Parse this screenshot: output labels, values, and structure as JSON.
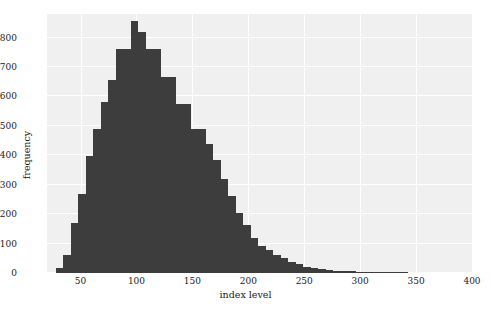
{
  "chart_data": {
    "type": "bar",
    "subtype": "histogram",
    "title": "",
    "xlabel": "index level",
    "ylabel": "frequency",
    "xlim": [
      20,
      400
    ],
    "ylim": [
      0,
      880
    ],
    "xticks": [
      50,
      100,
      150,
      200,
      250,
      300,
      350,
      400
    ],
    "yticks": [
      0,
      100,
      200,
      300,
      400,
      500,
      600,
      700,
      800
    ],
    "xtick_labels": [
      "50",
      "100",
      "150",
      "200",
      "250",
      "300",
      "350",
      "400"
    ],
    "ytick_labels": [
      "0",
      "100",
      "200",
      "300",
      "400",
      "500",
      "600",
      "700",
      "800"
    ],
    "grid": true,
    "legend": null,
    "bin_width": 6.7,
    "bar_color": "#3d3d3d",
    "plot_background": "#f0f0f0",
    "gridline_color": "#ffffff",
    "bin_starts": [
      28.0,
      34.7,
      41.4,
      48.1,
      54.8,
      61.5,
      68.2,
      74.9,
      81.6,
      88.3,
      95.0,
      101.7,
      108.4,
      115.1,
      121.8,
      128.5,
      135.2,
      141.9,
      148.6,
      155.3,
      162.0,
      168.7,
      175.4,
      182.1,
      188.8,
      195.5,
      202.2,
      208.9,
      215.6,
      222.3,
      229.0,
      235.7,
      242.4,
      249.1,
      255.8,
      262.5,
      269.2,
      275.9,
      282.6,
      289.3,
      296.0,
      302.7,
      309.4,
      316.1,
      322.8,
      329.5,
      336.2,
      342.9,
      349.6,
      356.3,
      363.0,
      369.7,
      376.4,
      383.1,
      389.8
    ],
    "bin_centers": [
      31.4,
      38.1,
      44.8,
      51.4,
      58.1,
      64.8,
      71.6,
      78.2,
      85.0,
      91.6,
      98.4,
      105.0,
      111.8,
      118.4,
      125.2,
      131.8,
      138.6,
      145.2,
      152.0,
      158.6,
      165.4,
      172.0,
      178.8,
      185.4,
      192.2,
      198.8,
      205.6,
      212.2,
      219.0,
      225.6,
      232.4,
      239.0,
      245.8,
      252.4,
      259.2,
      265.8,
      272.6,
      279.2,
      286.0,
      292.6,
      299.4,
      306.0,
      312.8,
      319.4,
      326.2,
      332.8,
      339.6,
      346.2,
      353.0,
      359.6,
      366.4,
      373.0,
      379.8,
      386.4,
      393.2
    ],
    "values": [
      17,
      60,
      170,
      268,
      396,
      490,
      580,
      655,
      760,
      760,
      855,
      820,
      760,
      760,
      665,
      665,
      575,
      575,
      490,
      490,
      440,
      385,
      320,
      260,
      205,
      162,
      120,
      92,
      78,
      62,
      50,
      38,
      30,
      22,
      17,
      14,
      10,
      8,
      7,
      6,
      5,
      4,
      3,
      3,
      2,
      2,
      2,
      1,
      1,
      1,
      1,
      1,
      1,
      1,
      1
    ],
    "peak_value": 855,
    "peak_bin_center": 98.4,
    "distribution_shape": "right-skewed"
  }
}
